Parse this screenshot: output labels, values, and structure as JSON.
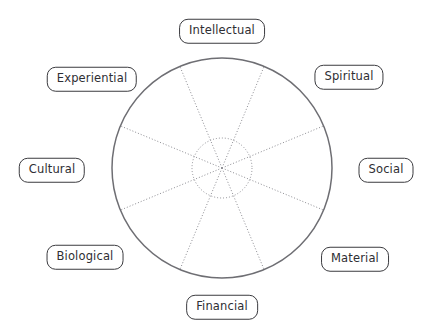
{
  "diagram": {
    "type": "radial-wheel",
    "title": "",
    "background_color": "#ffffff",
    "geometry": {
      "center_x": 222,
      "center_y": 168,
      "outer_radius": 110,
      "inner_radius": 30,
      "sector_count": 8,
      "spoke_angle_step_deg": 45,
      "spoke_angle_offset_deg": 22.5
    },
    "style": {
      "outer_circle_color": "#6e6e73",
      "inner_circle_color": "#8c8c92",
      "spoke_color": "#8c8c92",
      "label_border_color": "#3b3b3f",
      "label_text_color": "#2e2e33",
      "label_fill_color": "#ffffff"
    },
    "segments": [
      {
        "label": "Intellectual",
        "angle_deg": 270,
        "label_x": 222,
        "label_y": 31
      },
      {
        "label": "Spiritual",
        "angle_deg": 315,
        "label_x": 349,
        "label_y": 77
      },
      {
        "label": "Social",
        "angle_deg": 0,
        "label_x": 386,
        "label_y": 170
      },
      {
        "label": "Material",
        "angle_deg": 45,
        "label_x": 355,
        "label_y": 259
      },
      {
        "label": "Financial",
        "angle_deg": 90,
        "label_x": 222,
        "label_y": 307
      },
      {
        "label": "Biological",
        "angle_deg": 135,
        "label_x": 85,
        "label_y": 257
      },
      {
        "label": "Cultural",
        "angle_deg": 180,
        "label_x": 52,
        "label_y": 170
      },
      {
        "label": "Experiential",
        "angle_deg": 225,
        "label_x": 92,
        "label_y": 79
      }
    ]
  }
}
